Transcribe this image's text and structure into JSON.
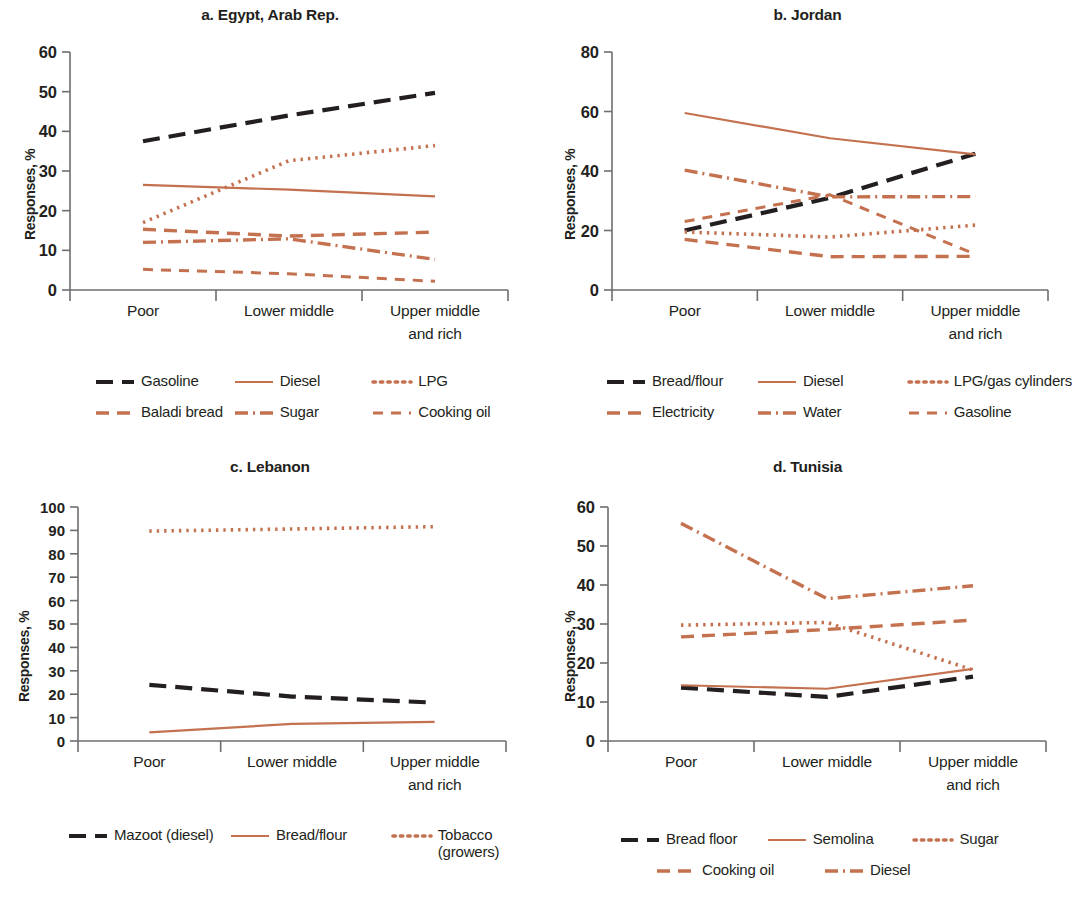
{
  "colors": {
    "black": "#231f20",
    "terracotta": "#c4714f",
    "axis": "#6d6e71"
  },
  "axis_common": {
    "ylabel": "Responses, %",
    "categories": [
      "Poor",
      "Lower middle",
      "Upper middle\nand rich"
    ]
  },
  "chart_data": [
    {
      "type": "line",
      "panel": "a",
      "title": "a. Egypt, Arab Rep.",
      "xlabel": "",
      "ylabel": "Responses, %",
      "categories": [
        "Poor",
        "Lower middle",
        "Upper middle and rich"
      ],
      "ylim": [
        0,
        60
      ],
      "yticks": [
        0,
        10,
        20,
        30,
        40,
        50,
        60
      ],
      "grid": false,
      "legend_position": "below",
      "series": [
        {
          "name": "Gasoline",
          "values": [
            37.5,
            44.0,
            49.7
          ],
          "color": "#231f20",
          "dash": "long"
        },
        {
          "name": "Diesel",
          "values": [
            26.5,
            25.3,
            23.6
          ],
          "color": "#c4714f",
          "dash": "solid"
        },
        {
          "name": "LPG",
          "values": [
            17.0,
            32.6,
            36.4
          ],
          "color": "#c4714f",
          "dash": "dotted"
        },
        {
          "name": "Baladi bread",
          "values": [
            15.3,
            13.6,
            14.6
          ],
          "color": "#c4714f",
          "dash": "dash"
        },
        {
          "name": "Sugar",
          "values": [
            12.0,
            12.9,
            7.7
          ],
          "color": "#c4714f",
          "dash": "dashdot"
        },
        {
          "name": "Cooking oil",
          "values": [
            5.2,
            4.1,
            2.2
          ],
          "color": "#c4714f",
          "dash": "shortdash"
        }
      ]
    },
    {
      "type": "line",
      "panel": "b",
      "title": "b. Jordan",
      "xlabel": "",
      "ylabel": "Responses, %",
      "categories": [
        "Poor",
        "Lower middle",
        "Upper middle and rich"
      ],
      "ylim": [
        0,
        80
      ],
      "yticks": [
        0,
        20,
        40,
        60,
        80
      ],
      "grid": false,
      "legend_position": "below",
      "series": [
        {
          "name": "Bread/flour",
          "values": [
            20.0,
            31.0,
            45.8
          ],
          "color": "#231f20",
          "dash": "long"
        },
        {
          "name": "Diesel",
          "values": [
            59.5,
            51.0,
            45.6
          ],
          "color": "#c4714f",
          "dash": "solid"
        },
        {
          "name": "LPG/gas cylinders",
          "values": [
            19.5,
            17.8,
            21.8
          ],
          "color": "#c4714f",
          "dash": "dotted"
        },
        {
          "name": "Electricity",
          "values": [
            17.0,
            11.2,
            11.3
          ],
          "color": "#c4714f",
          "dash": "dash"
        },
        {
          "name": "Water",
          "values": [
            40.3,
            31.3,
            31.4
          ],
          "color": "#c4714f",
          "dash": "dashdot"
        },
        {
          "name": "Gasoline",
          "values": [
            23.0,
            32.0,
            12.0
          ],
          "color": "#c4714f",
          "dash": "shortdash"
        }
      ]
    },
    {
      "type": "line",
      "panel": "c",
      "title": "c. Lebanon",
      "xlabel": "",
      "ylabel": "Responses, %",
      "categories": [
        "Poor",
        "Lower middle",
        "Upper middle and rich"
      ],
      "ylim": [
        0,
        100
      ],
      "yticks": [
        0,
        10,
        20,
        30,
        40,
        50,
        60,
        70,
        80,
        90,
        100
      ],
      "grid": false,
      "legend_position": "below",
      "series": [
        {
          "name": "Mazoot (diesel)",
          "values": [
            24.0,
            19.0,
            16.4
          ],
          "color": "#231f20",
          "dash": "long"
        },
        {
          "name": "Bread/flour",
          "values": [
            3.7,
            7.3,
            8.2
          ],
          "color": "#c4714f",
          "dash": "solid"
        },
        {
          "name": "Tobacco\n(growers)",
          "values": [
            89.7,
            90.6,
            91.6
          ],
          "color": "#c4714f",
          "dash": "dotted"
        }
      ]
    },
    {
      "type": "line",
      "panel": "d",
      "title": "d. Tunisia",
      "xlabel": "",
      "ylabel": "Responses, %",
      "categories": [
        "Poor",
        "Lower middle",
        "Upper middle and rich"
      ],
      "ylim": [
        0,
        60
      ],
      "yticks": [
        0,
        10,
        20,
        30,
        40,
        50,
        60
      ],
      "grid": false,
      "legend_position": "below",
      "series": [
        {
          "name": "Bread floor",
          "values": [
            13.7,
            11.3,
            16.5
          ],
          "color": "#231f20",
          "dash": "long"
        },
        {
          "name": "Semolina",
          "values": [
            14.3,
            13.4,
            18.5
          ],
          "color": "#c4714f",
          "dash": "solid"
        },
        {
          "name": "Sugar",
          "values": [
            29.7,
            30.4,
            18.2
          ],
          "color": "#c4714f",
          "dash": "dotted"
        },
        {
          "name": "Cooking oil",
          "values": [
            26.7,
            28.6,
            31.0
          ],
          "color": "#c4714f",
          "dash": "dash"
        },
        {
          "name": "Diesel",
          "values": [
            55.8,
            36.5,
            39.8
          ],
          "color": "#c4714f",
          "dash": "dashdot"
        }
      ]
    }
  ],
  "panels": {
    "a": {
      "title": "a. Egypt, Arab Rep.",
      "ylabel": "Responses, %",
      "legend": [
        {
          "label": "Gasoline"
        },
        {
          "label": "Diesel"
        },
        {
          "label": "LPG"
        },
        {
          "label": "Baladi bread"
        },
        {
          "label": "Sugar"
        },
        {
          "label": "Cooking oil"
        }
      ]
    },
    "b": {
      "title": "b. Jordan",
      "ylabel": "Responses, %",
      "legend": [
        {
          "label": "Bread/flour"
        },
        {
          "label": "Diesel"
        },
        {
          "label": "LPG/gas cylinders"
        },
        {
          "label": "Electricity"
        },
        {
          "label": "Water"
        },
        {
          "label": "Gasoline"
        }
      ]
    },
    "c": {
      "title": "c. Lebanon",
      "ylabel": "Responses, %",
      "legend": [
        {
          "label": "Mazoot (diesel)"
        },
        {
          "label": "Bread/flour"
        },
        {
          "label": "Tobacco\n(growers)"
        }
      ]
    },
    "d": {
      "title": "d. Tunisia",
      "ylabel": "Responses, %",
      "legend": [
        {
          "label": "Bread floor"
        },
        {
          "label": "Semolina"
        },
        {
          "label": "Sugar"
        },
        {
          "label": "Cooking oil"
        },
        {
          "label": "Diesel"
        }
      ]
    }
  }
}
